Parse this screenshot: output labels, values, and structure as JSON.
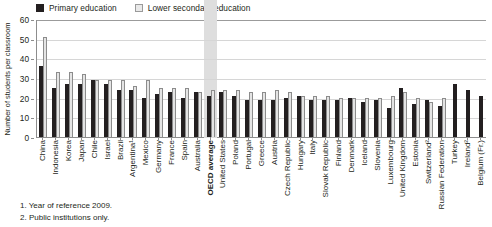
{
  "legend": {
    "items": [
      {
        "label": "Primary education",
        "swatch": "primary-swatch",
        "color": "#231f20"
      },
      {
        "label": "Lower secondary education",
        "swatch": "lower-secondary-swatch",
        "color": "#e9e9e9"
      }
    ]
  },
  "axis": {
    "ylabel": "Number of students per classroom",
    "yticks": [
      "0",
      "10",
      "20",
      "30",
      "40",
      "50",
      "60"
    ]
  },
  "notes": [
    "1. Year of reference 2009.",
    "2. Public institutions only."
  ],
  "highlight": {
    "category": "OECD average",
    "color": "#dedede"
  },
  "chart_data": {
    "type": "bar",
    "title": "",
    "xlabel": "",
    "ylabel": "Number of students per classroom",
    "ylim": [
      0,
      60
    ],
    "ytick_step": 10,
    "grid": true,
    "legend_position": "top-left",
    "categories": [
      "China",
      "Indonesia",
      "Korea",
      "Japan",
      "Chile",
      "Israel",
      "Brazil",
      "Argentina¹",
      "Mexico",
      "Germany",
      "France",
      "Spain",
      "Australia",
      "OECD average",
      "United States",
      "Poland",
      "Portugal",
      "Greece",
      "Austria",
      "Czech Republic",
      "Hungary",
      "Italy",
      "Slovak Republic",
      "Finland",
      "Denmark",
      "Iceland",
      "Slovenia",
      "Luxembourg",
      "United Kingdom",
      "Estonia",
      "Switzerland²",
      "Russian Federation",
      "Turkey",
      "Ireland²",
      "Belgium (Fr.)"
    ],
    "series": [
      {
        "name": "Primary education",
        "color": "#231f20",
        "values": [
          36,
          25,
          27,
          27,
          29,
          27,
          24,
          24,
          20,
          22,
          23,
          20,
          23,
          21,
          23,
          21,
          19,
          19,
          19,
          20,
          21,
          19,
          19,
          19,
          20,
          18,
          19,
          15,
          25,
          17,
          19,
          16,
          27,
          24,
          21
        ]
      },
      {
        "name": "Lower secondary education",
        "color": "#e4e4e4",
        "values": [
          51,
          33,
          33,
          32,
          29,
          29,
          29,
          26,
          29,
          25,
          25,
          25,
          23,
          24,
          24,
          24,
          23,
          23,
          24,
          23,
          21,
          21,
          21,
          20,
          20,
          20,
          20,
          21,
          23,
          20,
          18,
          20,
          null,
          null,
          null
        ]
      }
    ]
  }
}
